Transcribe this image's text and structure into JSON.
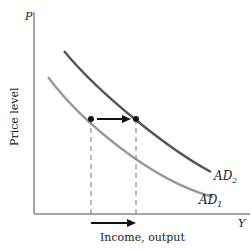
{
  "diagram": {
    "axes": {
      "y_label": "Price level",
      "y_symbol": "P",
      "x_label": "Income, output",
      "x_symbol": "Y"
    },
    "curves": [
      {
        "id": "AD1",
        "label_main": "AD",
        "label_sub": "1",
        "color": "#999999"
      },
      {
        "id": "AD2",
        "label_main": "AD",
        "label_sub": "2",
        "color": "#555555"
      }
    ],
    "shift_description": "Rightward shift of aggregate demand from AD1 to AD2 at a given price level, increasing income/output",
    "colors": {
      "axis": "#888888",
      "arrow": "#111111",
      "dashed": "#777777"
    }
  }
}
